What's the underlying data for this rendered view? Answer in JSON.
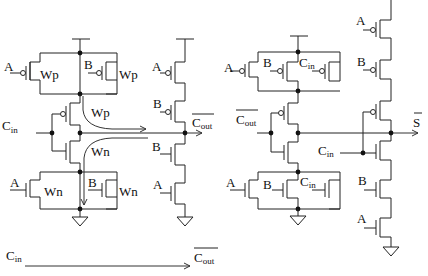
{
  "diagram": {
    "carry_circuit": {
      "inputs": {
        "a": "A",
        "b": "B",
        "cin_main": "C",
        "cin_sub": "in"
      },
      "widths": {
        "pmos_a": "Wp",
        "pmos_b": "Wp",
        "pmos_cin": "Wp",
        "nmos_cin": "Wn",
        "nmos_a": "Wn",
        "nmos_b": "Wn"
      },
      "output": {
        "main": "C",
        "sub": "out",
        "overbar": true
      },
      "inverter_inputs": {
        "top_a": "A",
        "top_b": "B",
        "bot_b": "B",
        "bot_a": "A"
      }
    },
    "sum_circuit": {
      "pullup_inputs": {
        "a": "A",
        "b": "B",
        "cin_main": "C",
        "cin_sub": "in"
      },
      "pulldown_inputs": {
        "a": "A",
        "b": "B",
        "cin_main": "C",
        "cin_sub": "in"
      },
      "cout_input": {
        "main": "C",
        "sub": "out",
        "overbar": true
      },
      "stack_inputs": {
        "top_a": "A",
        "top_b": "B",
        "cin_main": "C",
        "cin_sub": "in",
        "bot_b": "B",
        "bot_a": "A"
      },
      "output": {
        "main": "S",
        "overbar": true
      }
    },
    "legend": {
      "from_main": "C",
      "from_sub": "in",
      "to_main": "C",
      "to_sub": "out",
      "to_overbar": true
    },
    "colors": {
      "wire": "#222222",
      "node": "#111111",
      "background": "#ffffff"
    }
  }
}
